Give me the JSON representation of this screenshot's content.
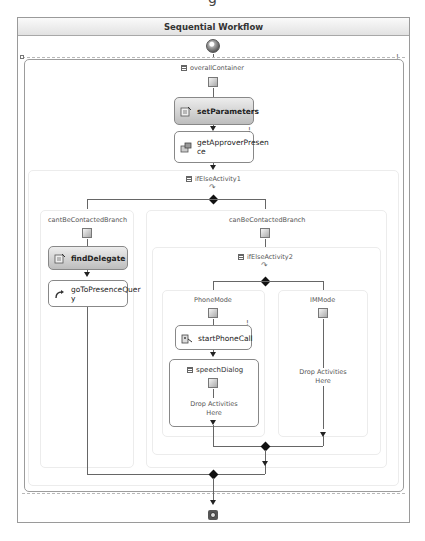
{
  "header_fragment": "g",
  "workflow": {
    "title": "Sequential Workflow",
    "container": {
      "name": "overallContainer",
      "activities": [
        {
          "name": "setParameters",
          "style": "shaded",
          "icon": "code-icon"
        },
        {
          "name": "getApproverPresen\nce",
          "display_lines": [
            "getApproverPresen",
            "ce"
          ],
          "style": "plain",
          "icon": "invoke-icon",
          "warning": "!"
        }
      ],
      "ifelse1": {
        "name": "ifElseActivity1",
        "branches": [
          {
            "name": "cantBeContactedBranch",
            "activities": [
              {
                "name": "findDelegate",
                "style": "shaded",
                "icon": "code-icon"
              },
              {
                "name_lines": [
                  "goToPresenceQuer",
                  "y"
                ],
                "style": "plain",
                "icon": "goto-icon"
              }
            ]
          },
          {
            "name": "canBeContactedBranch",
            "ifelse2": {
              "name": "ifElseActivity2",
              "branches": [
                {
                  "name": "PhoneMode",
                  "activities": [
                    {
                      "name": "startPhoneCall",
                      "style": "plain",
                      "icon": "phone-icon",
                      "warning": "!"
                    },
                    {
                      "name": "speechDialog",
                      "style": "container",
                      "drop_text": [
                        "Drop Activities",
                        "Here"
                      ]
                    }
                  ]
                },
                {
                  "name": "IMMode",
                  "drop_text": [
                    "Drop Activities",
                    "Here"
                  ]
                }
              ]
            }
          }
        ]
      }
    },
    "container_warning": "!"
  }
}
